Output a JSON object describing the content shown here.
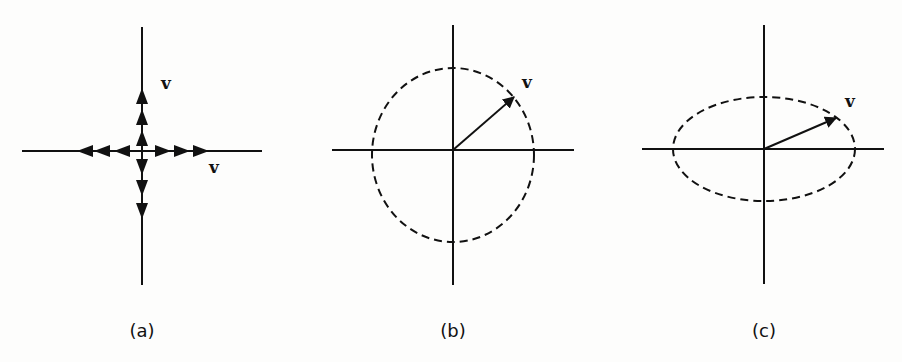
{
  "figure": {
    "panels": [
      {
        "id": "a",
        "caption": "(a)",
        "vector_label_up": "v",
        "vector_label_right": "v",
        "description": "Axes with arrows along the axes in both directions (eigenvectors stay on their lines)"
      },
      {
        "id": "b",
        "caption": "(b)",
        "vector_label": "v",
        "description": "Axes with dashed circle and vector v pointing to the upper right"
      },
      {
        "id": "c",
        "caption": "(c)",
        "vector_label": "v",
        "description": "Axes with dashed horizontal ellipse and vector v pointing to the upper right"
      }
    ],
    "colors": {
      "ink": "#111111",
      "background": "#fdfdfc"
    }
  }
}
